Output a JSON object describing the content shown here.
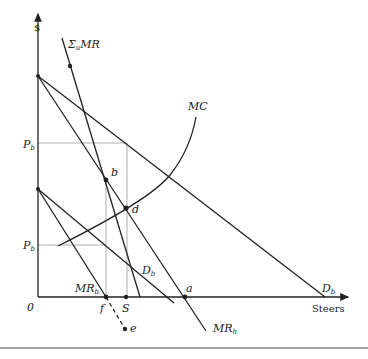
{
  "diagram": {
    "axes": {
      "y_label": "$",
      "x_label": "Steers",
      "origin_label": "0"
    },
    "price_labels": {
      "upper": {
        "main": "P",
        "sub": "b"
      },
      "lower": {
        "main": "P",
        "sub": "b"
      }
    },
    "curves": {
      "sum_mr": {
        "main": "Σ",
        "sub": "u",
        "tail": "MR"
      },
      "mc": "MC",
      "d_big": {
        "main": "D",
        "sub": "b"
      },
      "d_small": {
        "main": "D",
        "sub": "b"
      },
      "mr_b": {
        "main": "MR",
        "sub": "b"
      },
      "mr_h": {
        "main": "MR",
        "sub": "h"
      }
    },
    "points": {
      "b": "b",
      "d": "d",
      "a": "a",
      "f": "f",
      "s": "S",
      "e": "e"
    }
  }
}
